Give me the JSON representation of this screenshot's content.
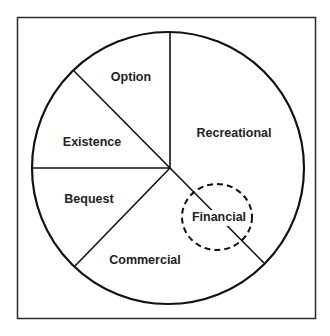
{
  "diagram": {
    "type": "pie-partition",
    "segments": [
      {
        "id": "option",
        "label": "Option"
      },
      {
        "id": "recreational",
        "label": "Recreational"
      },
      {
        "id": "commercial",
        "label": "Commercial"
      },
      {
        "id": "bequest",
        "label": "Bequest"
      },
      {
        "id": "existence",
        "label": "Existence"
      }
    ],
    "highlight": {
      "label": "Financial",
      "style": "dashed-circle",
      "spans": [
        "recreational",
        "commercial"
      ]
    },
    "colors": {
      "stroke": "#111111",
      "text": "#222222",
      "background": "#ffffff"
    }
  }
}
